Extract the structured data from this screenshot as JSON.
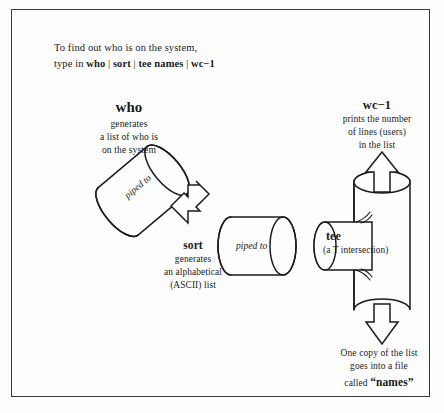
{
  "figure": {
    "intro": {
      "line1": "To find out who is on the system,",
      "line2_prefix": "type in ",
      "cmd1": "who",
      "sep": " | ",
      "cmd2": "sort",
      "cmd3": "tee names",
      "cmd4": "wc−1"
    },
    "nodes": {
      "who": {
        "heading": "who",
        "description": "generates\na list of who is\non the system"
      },
      "sort": {
        "heading": "sort",
        "description": "generates\nan alphabetical\n(ASCII) list"
      },
      "tee": {
        "heading": "tee",
        "description": "(a T intersection)"
      },
      "wc": {
        "heading": "wc−1",
        "description": "prints the number\nof lines (users)\nin the list"
      }
    },
    "pipes": {
      "label1": "piped to",
      "label2": "piped to"
    },
    "output": {
      "line1": "One copy of the list",
      "line2": "goes into a file",
      "line3_prefix": "called ",
      "filename": "“names”"
    },
    "colors": {
      "ink": "#1c1c1c",
      "paper": "#fefefe",
      "frame": "#3a3a3a"
    }
  }
}
